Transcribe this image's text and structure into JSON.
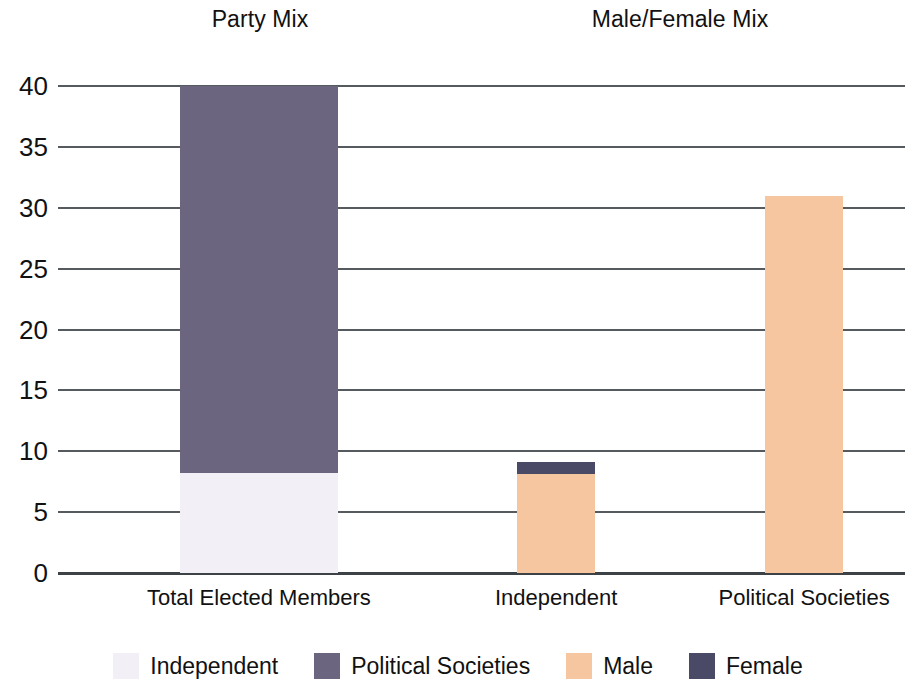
{
  "panels": [
    {
      "title": "Party Mix"
    },
    {
      "title": "Male/Female Mix"
    }
  ],
  "legend": [
    {
      "label": "Independent",
      "color": "#F2EFF7"
    },
    {
      "label": "Political Societies",
      "color": "#6B6580"
    },
    {
      "label": "Male",
      "color": "#F5C6A0"
    },
    {
      "label": "Female",
      "color": "#4A4A66"
    }
  ],
  "chart_data": {
    "type": "bar",
    "subtype": "stacked",
    "title": "",
    "panel_titles": [
      "Party Mix",
      "Male/Female Mix"
    ],
    "categories": [
      "Total Elected Members",
      "Independent",
      "Political Societies"
    ],
    "xlabel": "",
    "ylabel": "",
    "ylim": [
      0,
      40
    ],
    "yticks": [
      0,
      5,
      10,
      15,
      20,
      25,
      30,
      35,
      40
    ],
    "grid": true,
    "legend_position": "bottom",
    "series": [
      {
        "name": "Independent",
        "color": "#F2EFF7",
        "values": [
          8.2,
          0,
          0
        ]
      },
      {
        "name": "Political Societies",
        "color": "#6B6580",
        "values": [
          31.8,
          0,
          0
        ]
      },
      {
        "name": "Male",
        "color": "#F5C6A0",
        "values": [
          0,
          8.1,
          31.0
        ]
      },
      {
        "name": "Female",
        "color": "#4A4A66",
        "values": [
          0,
          1.0,
          0
        ]
      }
    ],
    "bars": [
      {
        "category": "Total Elected Members",
        "panel": "Party Mix",
        "total": 40,
        "segments": [
          {
            "name": "Independent",
            "value": 8.2,
            "color": "#F2EFF7"
          },
          {
            "name": "Political Societies",
            "value": 31.8,
            "color": "#6B6580"
          }
        ]
      },
      {
        "category": "Independent",
        "panel": "Male/Female Mix",
        "total": 9.1,
        "segments": [
          {
            "name": "Male",
            "value": 8.1,
            "color": "#F5C6A0"
          },
          {
            "name": "Female",
            "value": 1.0,
            "color": "#4A4A66"
          }
        ]
      },
      {
        "category": "Political Societies",
        "panel": "Male/Female Mix",
        "total": 31.0,
        "segments": [
          {
            "name": "Male",
            "value": 31.0,
            "color": "#F5C6A0"
          }
        ]
      }
    ]
  }
}
